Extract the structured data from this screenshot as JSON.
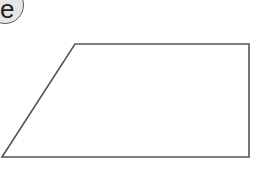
{
  "label": {
    "text": "e"
  },
  "shape": {
    "type": "trapezoid",
    "points": [
      [
        75,
        44
      ],
      [
        249,
        44
      ],
      [
        249,
        157
      ],
      [
        2,
        157
      ]
    ],
    "stroke": "#555555",
    "fill": "#ffffff"
  }
}
